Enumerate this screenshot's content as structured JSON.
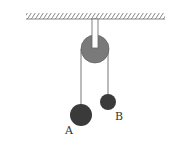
{
  "diagram": {
    "type": "pulley-system",
    "ceiling": {
      "x1": 26,
      "x2": 165,
      "y": 19
    },
    "pulley": {
      "cx": 95,
      "cy": 49,
      "r": 14,
      "color": "#7a7a7a"
    },
    "bracket": {
      "x": 92,
      "width": 6,
      "y1": 19,
      "y2": 48
    },
    "strings": [
      {
        "x": 81,
        "y1": 50,
        "y2": 105
      },
      {
        "x": 108,
        "y1": 50,
        "y2": 95
      }
    ],
    "masses": [
      {
        "label": "A",
        "cx": 81,
        "cy": 115,
        "r": 11,
        "label_x": 66,
        "label_y": 133
      },
      {
        "label": "B",
        "cx": 108,
        "cy": 102,
        "r": 8,
        "label_x": 115,
        "label_y": 120
      }
    ],
    "mass_color": "#3a3a3a"
  },
  "labels": {
    "a": "A",
    "b": "B"
  }
}
